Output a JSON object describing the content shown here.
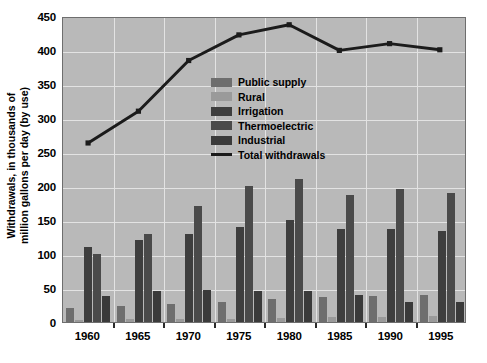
{
  "chart_data": {
    "type": "bar",
    "title": "",
    "xlabel": "",
    "ylabel_line1": "Withdrawals, in thousands of",
    "ylabel_line2": "million gallons per day (by use)",
    "categories": [
      "1960",
      "1965",
      "1970",
      "1975",
      "1980",
      "1985",
      "1990",
      "1995"
    ],
    "ylim": [
      0,
      450
    ],
    "yticks": [
      0,
      50,
      100,
      150,
      200,
      250,
      300,
      350,
      400,
      450
    ],
    "grid": true,
    "legend_position": "inside-upper-center",
    "plot_background": "#b9b9b9",
    "series": [
      {
        "name": "Public supply",
        "color": "#6e6e6e",
        "values": [
          21,
          24,
          27,
          29,
          34,
          37,
          38,
          40
        ]
      },
      {
        "name": "Rural",
        "color": "#9a9a9a",
        "values": [
          3.6,
          4.0,
          4.5,
          4.9,
          5.6,
          7.8,
          7.9,
          8.9
        ]
      },
      {
        "name": "Irrigation",
        "color": "#3e3e3e",
        "values": [
          110,
          120,
          130,
          140,
          150,
          137,
          137,
          134
        ]
      },
      {
        "name": "Thermoelectric",
        "color": "#4a4a4a",
        "values": [
          100,
          130,
          170,
          200,
          210,
          187,
          195,
          190
        ]
      },
      {
        "name": "Industrial",
        "color": "#3a3a3a",
        "values": [
          38,
          46,
          47,
          45,
          45,
          40,
          30,
          29
        ]
      }
    ],
    "line_series": {
      "name": "Total withdrawals",
      "color": "#1b1b1b",
      "values": [
        265,
        312,
        387,
        425,
        440,
        402,
        412,
        403
      ]
    }
  },
  "legend": {
    "items": [
      {
        "label": "Public supply",
        "type": "swatch"
      },
      {
        "label": "Rural",
        "type": "swatch"
      },
      {
        "label": "Irrigation",
        "type": "swatch"
      },
      {
        "label": "Thermoelectric",
        "type": "swatch"
      },
      {
        "label": "Industrial",
        "type": "swatch"
      },
      {
        "label": "Total withdrawals",
        "type": "line"
      }
    ]
  }
}
